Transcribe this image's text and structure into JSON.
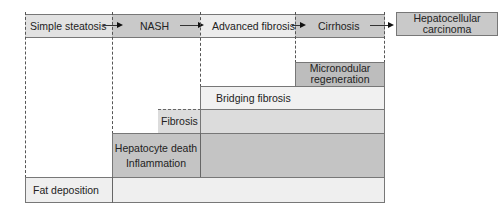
{
  "diagram": {
    "stages": [
      {
        "label": "Simple steatosis",
        "color": "#e2e2e2"
      },
      {
        "label": "NASH",
        "color": "#c9c9c9"
      },
      {
        "label": "Advanced fibrosis",
        "color": "#ececec"
      },
      {
        "label": "Cirrhosis",
        "color": "#c9c9c9"
      }
    ],
    "terminal_stage": {
      "line1": "Hepatocellular",
      "line2": "carcinoma",
      "color": "#c9c9c9"
    },
    "layers": {
      "micronodular": {
        "line1": "Micronodular",
        "line2": "regeneration",
        "color": "#bdbdbd"
      },
      "bridging_fibrosis": {
        "label": "Bridging fibrosis",
        "color": "#f1f1f1"
      },
      "fibrosis": {
        "label": "Fibrosis",
        "color": "#dcdcdc"
      },
      "hepatocyte": {
        "line1": "Hepatocyte death",
        "line2": "Inflammation",
        "color": "#c4c4c4"
      },
      "fat_deposition": {
        "label": "Fat deposition",
        "color": "#efefef"
      }
    }
  }
}
